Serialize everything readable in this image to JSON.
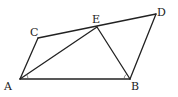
{
  "diagram": {
    "points": {
      "A": {
        "label": "A",
        "x": 20,
        "y": 79,
        "lx": 4,
        "ly": 90
      },
      "B": {
        "label": "B",
        "x": 130,
        "y": 79,
        "lx": 131,
        "ly": 90
      },
      "C": {
        "label": "C",
        "x": 38,
        "y": 38,
        "lx": 30,
        "ly": 36
      },
      "E": {
        "label": "E",
        "x": 97,
        "y": 27,
        "lx": 92,
        "ly": 23
      },
      "D": {
        "label": "D",
        "x": 156,
        "y": 14,
        "lx": 157,
        "ly": 16
      }
    },
    "segments": [
      [
        "A",
        "B"
      ],
      [
        "A",
        "C"
      ],
      [
        "C",
        "D"
      ],
      [
        "A",
        "E"
      ],
      [
        "E",
        "B"
      ],
      [
        "B",
        "D"
      ]
    ],
    "angle_marks": [
      "A",
      "B"
    ],
    "colors": {
      "stroke": "#222222",
      "label": "#222222"
    }
  }
}
